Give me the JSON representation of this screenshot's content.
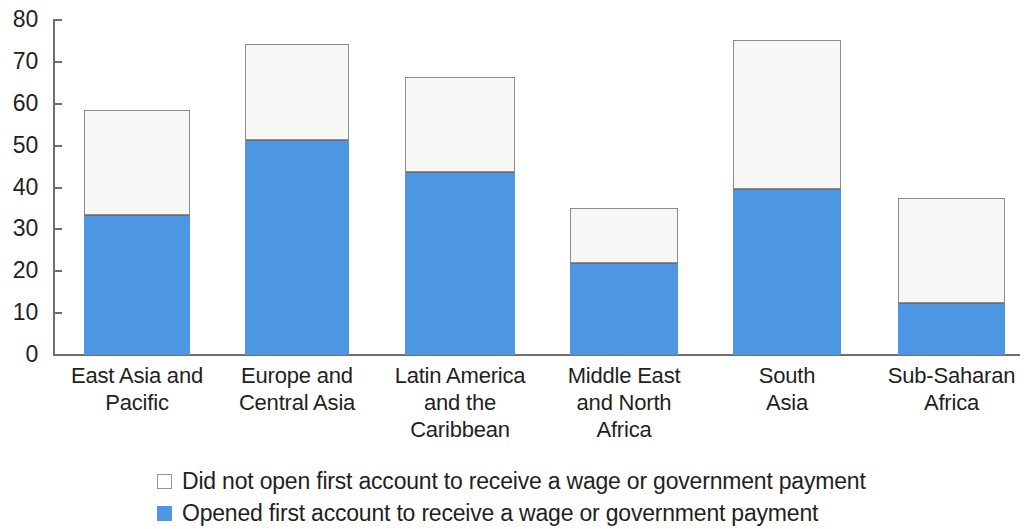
{
  "chart_data": {
    "type": "bar",
    "stacked": true,
    "title": "",
    "subtitle": "",
    "xlabel": "",
    "ylabel": "",
    "ylim": [
      0,
      80
    ],
    "ytick_labels": [
      "80",
      "70",
      "60",
      "50",
      "40",
      "30",
      "20",
      "10",
      "0"
    ],
    "ytick_values": [
      80,
      70,
      60,
      50,
      40,
      30,
      20,
      10,
      0
    ],
    "grid": false,
    "legend_position": "bottom",
    "categories": [
      "East Asia and Pacific",
      "Europe and Central Asia",
      "Latin America and the Caribbean",
      "Middle East and North Africa",
      "South Asia",
      "Sub-Saharan Africa"
    ],
    "category_lines": [
      [
        "East Asia and",
        "Pacific"
      ],
      [
        "Europe and",
        "Central Asia"
      ],
      [
        "Latin America",
        "and the",
        "Caribbean"
      ],
      [
        "Middle East",
        "and North",
        "Africa"
      ],
      [
        "South",
        "Asia"
      ],
      [
        "Sub-Saharan",
        "Africa"
      ]
    ],
    "series": [
      {
        "name": "Opened first account to receive a wage or government payment",
        "color": "#4d96e3",
        "values": [
          33.4,
          51.3,
          43.7,
          22.0,
          39.6,
          12.4
        ]
      },
      {
        "name": "Did not open first account to receive a wage or government payment",
        "color": "#ffffff",
        "values": [
          25.1,
          22.9,
          22.6,
          13.1,
          35.6,
          25.1
        ]
      }
    ],
    "totals": [
      58.5,
      74.2,
      66.3,
      35.1,
      75.2,
      37.5
    ]
  },
  "legend": {
    "items": [
      {
        "label": "Did not open first account to receive a wage or government payment",
        "swatch": "white"
      },
      {
        "label": "Opened first account to receive a wage or government payment",
        "swatch": "blue"
      }
    ]
  },
  "colors": {
    "blue": "#4d96e3",
    "white": "#ffffff",
    "axis": "#6d6e71",
    "outline": "#8a8c8e",
    "text": "#231f20"
  }
}
